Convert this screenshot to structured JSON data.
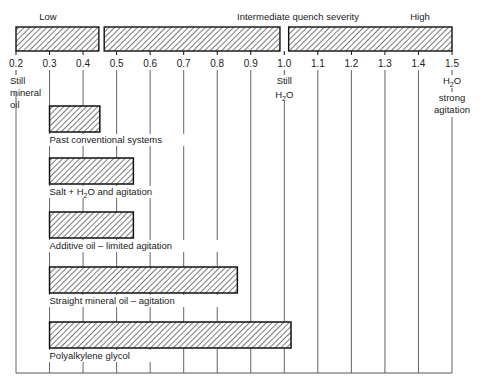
{
  "chart_data": {
    "type": "bar",
    "orientation": "horizontal",
    "title": "",
    "xlabel": "Quench severity (H)",
    "ylabel": "",
    "xlim": [
      0.2,
      1.5
    ],
    "x_ticks": [
      "0.2",
      "0.3",
      "0.4",
      "0.5",
      "0.6",
      "0.7",
      "0.8",
      "0.9",
      "1.0",
      "1.1",
      "1.2",
      "1.3",
      "1.4",
      "1.5"
    ],
    "grid": true,
    "severity_scale": {
      "segments": [
        {
          "label": "Low",
          "start": 0.2,
          "end": 0.45
        },
        {
          "label": "Intermediate quench severity",
          "start": 0.46,
          "end": 0.99
        },
        {
          "label": "High",
          "start": 1.01,
          "end": 1.5
        }
      ]
    },
    "reference_annotations": [
      {
        "x": 0.2,
        "lines": [
          "Still",
          "mineral",
          "oil"
        ]
      },
      {
        "x": 1.0,
        "lines": [
          "Still",
          "H2O"
        ]
      },
      {
        "x": 1.5,
        "lines": [
          "H2O",
          "strong",
          "agitation"
        ]
      }
    ],
    "categories": [
      "Past conventional systems",
      "Salt + H2O and agitation",
      "Additive oil – limited agitation",
      "Straight mineral oil – agitation",
      "Polyalkylene glycol"
    ],
    "ranges": [
      [
        0.3,
        0.45
      ],
      [
        0.3,
        0.55
      ],
      [
        0.3,
        0.55
      ],
      [
        0.3,
        0.86
      ],
      [
        0.3,
        1.02
      ]
    ]
  },
  "labels": {
    "low": "Low",
    "intermediate": "Intermediate quench severity",
    "high": "High",
    "still_oil": [
      "Still",
      "mineral",
      "oil"
    ],
    "still_water_1": "Still",
    "still_water_2": "H",
    "strong_1": "H",
    "strong_2": "strong",
    "strong_3": "agitation"
  }
}
